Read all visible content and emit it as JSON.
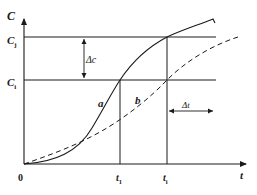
{
  "diagram": {
    "y_axis_label": "C",
    "x_axis_label": "t",
    "origin_label": "0",
    "levels": [
      {
        "label": "C",
        "sub": "j",
        "y": 37
      },
      {
        "label": "C",
        "sub": "i",
        "y": 80
      }
    ],
    "times": [
      {
        "label": "t",
        "sub": "1",
        "x": 120
      },
      {
        "label": "t",
        "sub": "i",
        "x": 167
      }
    ],
    "delta_c_label": "Δc",
    "delta_t_label": "Δt",
    "curves": [
      {
        "name": "a",
        "style": "solid",
        "label": "a"
      },
      {
        "name": "b",
        "style": "dashed",
        "label": "b"
      }
    ],
    "line_color": "#1a1a1a"
  }
}
